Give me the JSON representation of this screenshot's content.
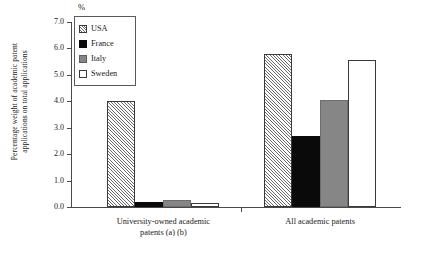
{
  "chart_data": {
    "type": "bar",
    "title": "",
    "subtitle": "",
    "unit_label": "%",
    "xlabel": "",
    "ylabel": "Percentage weight of academic patent\napplications on total applications",
    "ylim": [
      0.0,
      7.0
    ],
    "ytick_step": 1.0,
    "ytick_labels": [
      "7.0",
      "6.0",
      "5.0",
      "4.0",
      "3.0",
      "2.0",
      "1.0",
      "0.0"
    ],
    "ytick_values": [
      7.0,
      6.0,
      5.0,
      4.0,
      3.0,
      2.0,
      1.0,
      0.0
    ],
    "grid": false,
    "legend_position": "top-left",
    "categories": [
      "University-owned academic\npatents (a) (b)",
      "All academic patents"
    ],
    "series": [
      {
        "name": "USA",
        "color": "#ffffff",
        "pattern": "diagonal-hatch",
        "values": [
          4.0,
          5.8
        ]
      },
      {
        "name": "France",
        "color": "#0a0a0a",
        "pattern": "solid",
        "values": [
          0.2,
          2.7
        ]
      },
      {
        "name": "Italy",
        "color": "#868686",
        "pattern": "solid",
        "values": [
          0.25,
          4.05
        ]
      },
      {
        "name": "Sweden",
        "color": "#ffffff",
        "pattern": "outline",
        "values": [
          0.15,
          5.55
        ]
      }
    ]
  },
  "legend": {
    "items": [
      {
        "label": "USA"
      },
      {
        "label": "France"
      },
      {
        "label": "Italy"
      },
      {
        "label": "Sweden"
      }
    ]
  }
}
